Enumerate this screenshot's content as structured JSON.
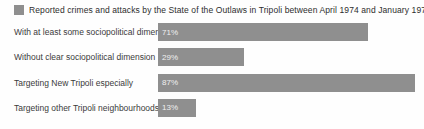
{
  "chart_data": {
    "type": "bar",
    "orientation": "horizontal",
    "title": "Reported crimes and attacks by the State of the Outlaws in Tripoli between April 1974 and January 1975",
    "categories": [
      "With at least some sociopolitical dimension",
      "Without clear sociopolitical dimension",
      "Targeting New Tripoli especially",
      "Targeting other Tripoli neighbourhoods"
    ],
    "values": [
      71,
      29,
      87,
      13
    ],
    "value_labels": [
      "71%",
      "29%",
      "87%",
      "13%"
    ],
    "xlim": [
      0,
      90
    ],
    "grid": false,
    "legend_position": "top-left",
    "bar_color": "#8f8f8f",
    "value_label_color": "#f0f0f0",
    "title_color": "#2d2d2d",
    "category_label_color": "#3b3b3b",
    "background_color": "#fefefe"
  }
}
